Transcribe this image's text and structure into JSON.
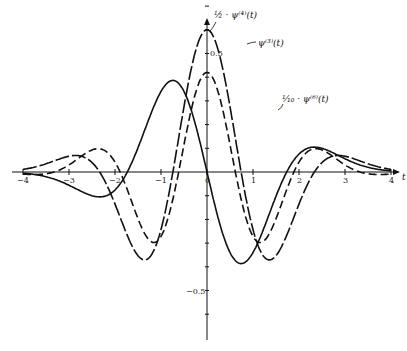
{
  "chart_data": {
    "type": "line",
    "title": "",
    "xlabel": "t",
    "ylabel": "",
    "xlim": [
      -4,
      4
    ],
    "ylim": [
      -0.7,
      0.7
    ],
    "x_ticks": [
      "-4",
      "-3",
      "-2",
      "-1",
      "0",
      "1",
      "2",
      "3",
      "4"
    ],
    "y_ticks": [
      "0.5",
      "-0.5"
    ],
    "grid": false,
    "series": [
      {
        "name": "ψ⁽³⁾(t)",
        "style": "solid",
        "peak": {
          "t": 0.75,
          "y": 0.55
        },
        "trough": {
          "t": -0.75,
          "y": -0.55
        }
      },
      {
        "name": "½·ψ⁽⁴⁾(t)",
        "style": "long-dash",
        "peak": {
          "t": 0,
          "y": 0.6
        }
      },
      {
        "name": "1/10·ψ⁽⁶⁾(t)",
        "style": "dashed",
        "peak": {
          "t": 1.1,
          "y": 0.4
        }
      }
    ],
    "annotations": [
      "½ · ψ⁽⁴⁾(t)",
      "ψ⁽³⁾(t)",
      "1/10 · ψ⁽⁶⁾(t)"
    ]
  },
  "labels": {
    "psi4": "½ · ψ⁽⁴⁾(t)",
    "psi3": "ψ⁽³⁾(t)",
    "psi6": "¹⁄₁₀ · ψ⁽⁶⁾(t)",
    "ytick_pos": "0.5",
    "ytick_neg": "−0.5",
    "xticks": [
      "−4",
      "−3",
      "−2",
      "−1",
      "0",
      "1",
      "2",
      "3",
      "4"
    ],
    "x_axis": "t"
  }
}
